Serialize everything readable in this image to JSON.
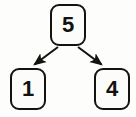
{
  "diagram": {
    "type": "binary-tree",
    "title": "",
    "node_shape": "rounded-rectangle",
    "colors": {
      "background": "#fdfdfb",
      "node_fill": "#fcfcfa",
      "stroke": "#15130f",
      "text": "#141210"
    },
    "nodes": [
      {
        "id": "root",
        "label": "5",
        "role": "root",
        "x": 50,
        "y": 4,
        "width": 36,
        "height": 42
      },
      {
        "id": "left",
        "label": "1",
        "role": "left-child",
        "x": 10,
        "y": 68,
        "width": 36,
        "height": 42
      },
      {
        "id": "right",
        "label": "4",
        "role": "right-child",
        "x": 94,
        "y": 68,
        "width": 36,
        "height": 42
      }
    ],
    "edges": [
      {
        "id": "edge-root-left",
        "from": "root",
        "to": "left",
        "label": "",
        "arrow": "filled-triangle",
        "direction": "down-left"
      },
      {
        "id": "edge-root-right",
        "from": "root",
        "to": "right",
        "label": "",
        "arrow": "filled-triangle",
        "direction": "down-right"
      }
    ]
  }
}
